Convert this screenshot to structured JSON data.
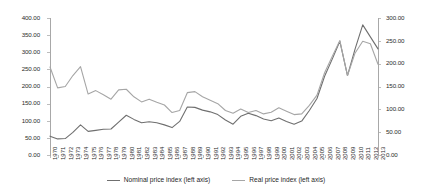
{
  "chart_data": {
    "type": "line",
    "title": "",
    "xlabel": "",
    "ylabel": "",
    "ylim": [
      0,
      400
    ],
    "ylim_right": [
      0,
      300
    ],
    "grid": false,
    "legend_position": "bottom",
    "y_ticks_left": [
      "0.00",
      "50.00",
      "100.00",
      "150.00",
      "200.00",
      "250.00",
      "300.00",
      "350.00",
      "400.00"
    ],
    "y_ticks_right": [
      "0.00",
      "50.00",
      "100.00",
      "150.00",
      "200.00",
      "250.00",
      "300.00"
    ],
    "categories": [
      "1970",
      "1971",
      "1972",
      "1973",
      "1974",
      "1975",
      "1976",
      "1977",
      "1978",
      "1979",
      "1980",
      "1981",
      "1982",
      "1983",
      "1984",
      "1985",
      "1986",
      "1987",
      "1988",
      "1989",
      "1990",
      "1991",
      "1992",
      "1993",
      "1994",
      "1995",
      "1996",
      "1997",
      "1998",
      "1999",
      "2000",
      "2001",
      "2002",
      "2003",
      "2004",
      "2005",
      "2006",
      "2007",
      "2008",
      "2009",
      "2010",
      "2011",
      "2012",
      "2013"
    ],
    "series": [
      {
        "name": "Nominal price index (left axis)",
        "color": "#6f6f6f",
        "axis": "left",
        "values": [
          55,
          47,
          48,
          66,
          88,
          69,
          72,
          75,
          76,
          96,
          116,
          104,
          94,
          97,
          94,
          88,
          80,
          98,
          140,
          139,
          131,
          126,
          118,
          102,
          90,
          113,
          122,
          115,
          105,
          100,
          108,
          98,
          90,
          99,
          130,
          165,
          230,
          280,
          332,
          232,
          310,
          380,
          345,
          310
        ]
      },
      {
        "name": "Real price index (left axis)",
        "color": "#a6a6a6",
        "axis": "left",
        "values": [
          257,
          196,
          200,
          232,
          258,
          178,
          188,
          176,
          163,
          190,
          192,
          170,
          155,
          163,
          154,
          146,
          124,
          130,
          182,
          185,
          170,
          160,
          150,
          130,
          122,
          134,
          124,
          130,
          120,
          125,
          138,
          128,
          118,
          120,
          145,
          175,
          240,
          288,
          334,
          232,
          298,
          332,
          325,
          265
        ]
      }
    ]
  },
  "legend": {
    "items": [
      {
        "label": "Nominal price index (left axis)",
        "swatch": "line-swatch-nominal"
      },
      {
        "label": "Real price index (left axis)",
        "swatch": "line-swatch-real"
      }
    ]
  },
  "colors": {
    "nominal": "#6f6f6f",
    "real": "#a6a6a6",
    "axis": "#a8a8a8",
    "tick": "#bdbdbd",
    "text": "#2b2b2b",
    "background": "#ffffff"
  }
}
